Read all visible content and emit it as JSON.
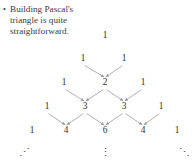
{
  "caption": {
    "bullet_glyph": "•",
    "text": "Building Pascal's triangle is quite straightforward."
  },
  "figure": {
    "name": "pascals-triangle",
    "arrow_color": "#9a9a9a",
    "text_color": "#2f2f2f",
    "rows": [
      {
        "index": 1,
        "y": 36,
        "values": [
          "1"
        ],
        "xs": [
          105
        ]
      },
      {
        "index": 2,
        "y": 59,
        "values": [
          "1",
          "1"
        ],
        "xs": [
          83,
          124
        ]
      },
      {
        "index": 3,
        "y": 83,
        "values": [
          "1",
          "2",
          "1"
        ],
        "xs": [
          64,
          105,
          143
        ]
      },
      {
        "index": 4,
        "y": 107,
        "values": [
          "1",
          "3",
          "3",
          "1"
        ],
        "xs": [
          47,
          85,
          124,
          161
        ]
      },
      {
        "index": 5,
        "y": 131,
        "values": [
          "1",
          "4",
          "6",
          "4",
          "1"
        ],
        "xs": [
          32,
          66,
          105,
          143,
          177
        ]
      }
    ],
    "arrows": [
      {
        "from_row": 2,
        "from_index": 0,
        "to_row": 3,
        "to_index": 1
      },
      {
        "from_row": 2,
        "from_index": 1,
        "to_row": 3,
        "to_index": 1
      },
      {
        "from_row": 3,
        "from_index": 0,
        "to_row": 4,
        "to_index": 1
      },
      {
        "from_row": 3,
        "from_index": 1,
        "to_row": 4,
        "to_index": 1
      },
      {
        "from_row": 3,
        "from_index": 1,
        "to_row": 4,
        "to_index": 2
      },
      {
        "from_row": 3,
        "from_index": 2,
        "to_row": 4,
        "to_index": 2
      },
      {
        "from_row": 4,
        "from_index": 0,
        "to_row": 5,
        "to_index": 1
      },
      {
        "from_row": 4,
        "from_index": 1,
        "to_row": 5,
        "to_index": 1
      },
      {
        "from_row": 4,
        "from_index": 1,
        "to_row": 5,
        "to_index": 2
      },
      {
        "from_row": 4,
        "from_index": 2,
        "to_row": 5,
        "to_index": 2
      },
      {
        "from_row": 4,
        "from_index": 2,
        "to_row": 5,
        "to_index": 3
      },
      {
        "from_row": 4,
        "from_index": 3,
        "to_row": 5,
        "to_index": 3
      }
    ],
    "ellipses": [
      {
        "name": "ellipsis-bottom-left",
        "glyph": "⋰",
        "x": 24,
        "y": 152
      },
      {
        "name": "ellipsis-bottom-center",
        "glyph": "⋮",
        "x": 105,
        "y": 152
      },
      {
        "name": "ellipsis-bottom-right",
        "glyph": "⋱",
        "x": 184,
        "y": 152
      }
    ]
  },
  "chart_data": {
    "type": "diagram",
    "rows": [
      [
        1
      ],
      [
        1,
        1
      ],
      [
        1,
        2,
        1
      ],
      [
        1,
        3,
        3,
        1
      ],
      [
        1,
        4,
        6,
        4,
        1
      ]
    ],
    "annotation": "Each interior entry is the sum of the two entries above it, shown by converging arrows."
  }
}
